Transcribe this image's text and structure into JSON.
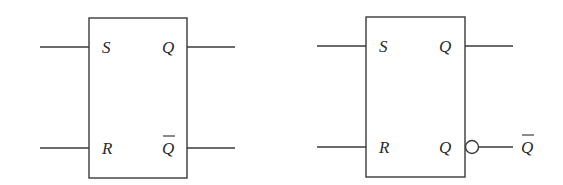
{
  "diagram": {
    "colors": {
      "stroke": "#3a3a3a",
      "text": "#2a2a2a",
      "background": "#ffffff"
    },
    "blocks": [
      {
        "id": "sr-latch-dual-output",
        "inputs": {
          "top": "S",
          "bottom": "R"
        },
        "outputs": {
          "top": "Q",
          "bottom": "Q",
          "bottom_overbar": true
        },
        "bubble": false
      },
      {
        "id": "sr-latch-inverted-output",
        "inputs": {
          "top": "S",
          "bottom": "R"
        },
        "outputs": {
          "top": "Q",
          "bottom": "Q",
          "bottom_overbar": false
        },
        "bubble": true,
        "external_output_label": "Q",
        "external_output_overbar": true
      }
    ]
  }
}
